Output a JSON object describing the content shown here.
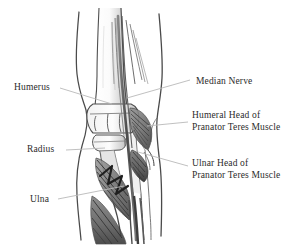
{
  "figure": {
    "background_color": "#ffffff",
    "ink_color": "#2b2b2b",
    "leader_line_color": "#b9b9b9",
    "width": 302,
    "height": 246
  },
  "labels": {
    "humerus": {
      "text": "Humerus",
      "side": "left",
      "x": 14,
      "y": 82
    },
    "radius": {
      "text": "Radius",
      "side": "left",
      "x": 27,
      "y": 144
    },
    "ulna": {
      "text": "Ulna",
      "side": "left",
      "x": 30,
      "y": 194
    },
    "median_nerve": {
      "text": "Median Nerve",
      "side": "right",
      "x": 196,
      "y": 76
    },
    "humeral_head_line1": {
      "text": "Humeral Head of",
      "side": "right",
      "x": 192,
      "y": 110
    },
    "humeral_head_line2": {
      "text": "Pranator Teres Muscle",
      "side": "right",
      "x": 192,
      "y": 122
    },
    "ulnar_head_line1": {
      "text": "Ulnar Head of",
      "side": "right",
      "x": 192,
      "y": 158
    },
    "ulnar_head_line2": {
      "text": "Pranator Teres Muscle",
      "side": "right",
      "x": 192,
      "y": 170
    }
  },
  "anatomy": {
    "structures": [
      "humerus",
      "radius",
      "ulna",
      "median-nerve",
      "humeral-head-pronator-teres",
      "ulnar-head-pronator-teres",
      "skin-contour-medial",
      "skin-contour-lateral"
    ]
  }
}
